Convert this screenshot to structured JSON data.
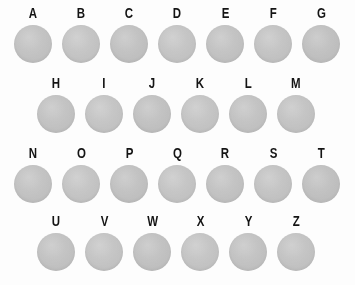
{
  "plate": {
    "background_color": "#fdfdfd",
    "spot_color": "#c0c0c0",
    "label_color": "#141414",
    "rows": [
      {
        "row_index": 0,
        "indent": "none",
        "spots": [
          {
            "label": "A"
          },
          {
            "label": "B"
          },
          {
            "label": "C"
          },
          {
            "label": "D"
          },
          {
            "label": "E"
          },
          {
            "label": "F"
          },
          {
            "label": "G"
          }
        ]
      },
      {
        "row_index": 1,
        "indent": "half",
        "spots": [
          {
            "label": "H"
          },
          {
            "label": "I"
          },
          {
            "label": "J"
          },
          {
            "label": "K"
          },
          {
            "label": "L"
          },
          {
            "label": "M"
          }
        ]
      },
      {
        "row_index": 2,
        "indent": "none",
        "spots": [
          {
            "label": "N"
          },
          {
            "label": "O"
          },
          {
            "label": "P"
          },
          {
            "label": "Q"
          },
          {
            "label": "R"
          },
          {
            "label": "S"
          },
          {
            "label": "T"
          }
        ]
      },
      {
        "row_index": 3,
        "indent": "half",
        "spots": [
          {
            "label": "U"
          },
          {
            "label": "V"
          },
          {
            "label": "W"
          },
          {
            "label": "X"
          },
          {
            "label": "Y"
          },
          {
            "label": "Z"
          }
        ]
      }
    ]
  }
}
